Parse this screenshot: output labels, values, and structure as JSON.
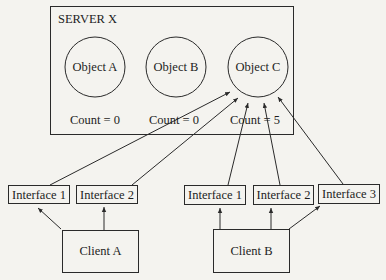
{
  "server": {
    "title": "SERVER X",
    "objects": [
      {
        "label": "Object A",
        "count": "Count = 0"
      },
      {
        "label": "Object B",
        "count": "Count = 0"
      },
      {
        "label": "Object C",
        "count": "Count = 5"
      }
    ]
  },
  "clients": [
    {
      "label": "Client A",
      "interfaces": [
        "Interface 1",
        "Interface 2"
      ]
    },
    {
      "label": "Client B",
      "interfaces": [
        "Interface 1",
        "Interface 2",
        "Interface 3"
      ]
    }
  ],
  "colors": {
    "stroke": "#2a2a2a",
    "background": "#f4f3ef"
  }
}
